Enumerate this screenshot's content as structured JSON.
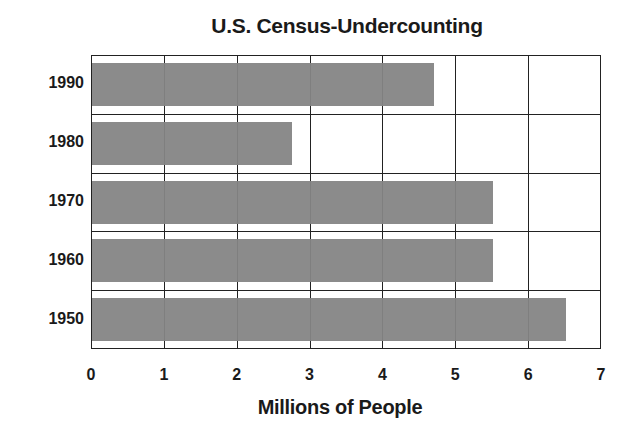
{
  "chart_data": {
    "type": "bar",
    "orientation": "horizontal",
    "title": "U.S. Census-Undercounting",
    "xlabel": "Millions of People",
    "ylabel": "",
    "categories": [
      "1990",
      "1980",
      "1970",
      "1960",
      "1950"
    ],
    "values": [
      4.7,
      2.75,
      5.5,
      5.5,
      6.5
    ],
    "xlim": [
      0,
      7
    ],
    "xticks": [
      "0",
      "1",
      "2",
      "3",
      "4",
      "5",
      "6",
      "7"
    ],
    "grid": true,
    "legend": null,
    "bar_color": "#858585"
  }
}
